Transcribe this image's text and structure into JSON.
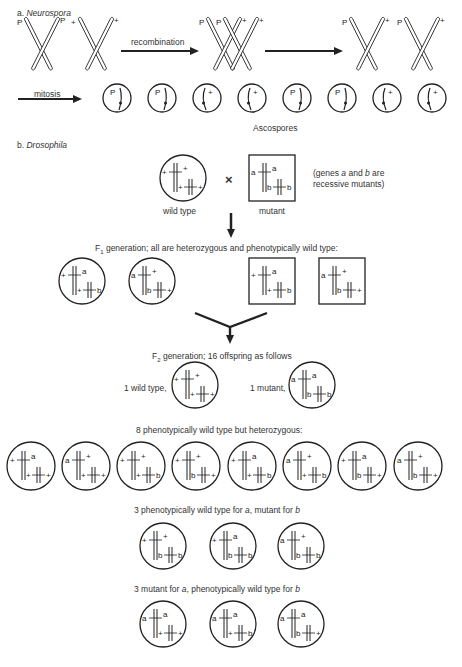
{
  "section_a": {
    "label": "a.",
    "organism": "Neurospora",
    "parental_chromosomes": [
      {
        "left_tip": "P",
        "right_tip": "P"
      },
      {
        "left_tip": "+",
        "right_tip": "+"
      }
    ],
    "recombination_label": "recombination",
    "recombinant_chromosomes": [
      {
        "left_tip": "P",
        "right_tip": "+"
      },
      {
        "left_tip": "P",
        "right_tip": "+"
      }
    ],
    "product_chromosomes": [
      {
        "left_tip": "P",
        "right_tip": "+"
      },
      {
        "left_tip": "P",
        "right_tip": "+"
      }
    ],
    "mitosis_label": "mitosis",
    "ascospores": [
      "P",
      "P",
      "+",
      "+",
      "P",
      "P",
      "+",
      "+"
    ],
    "ascospores_label": "Ascospores"
  },
  "section_b": {
    "label": "b.",
    "organism": "Drosophila",
    "parents": {
      "wild_type": {
        "shape": "circle",
        "chrom1": [
          "+",
          "+"
        ],
        "chrom2": [
          "+",
          "+"
        ],
        "label": "wild type"
      },
      "cross_symbol": "×",
      "mutant": {
        "shape": "square",
        "chrom1": [
          "a",
          "a"
        ],
        "chrom2": [
          "b",
          "b"
        ],
        "label": "mutant"
      },
      "note_line1_pre": "(genes ",
      "note_gene_a": "a",
      "note_line1_mid": " and ",
      "note_gene_b": "b",
      "note_line1_post": " are",
      "note_line2": "recessive mutants)"
    },
    "f1": {
      "heading_prefix": "F",
      "heading_sub": "1",
      "heading_text": " generation; all are heterozygous and phenotypically wild type:",
      "individuals": [
        {
          "shape": "circle",
          "chrom1": [
            "+",
            "a"
          ],
          "chrom2": [
            "+",
            "b"
          ]
        },
        {
          "shape": "circle",
          "chrom1": [
            "a",
            "+"
          ],
          "chrom2": [
            "b",
            "+"
          ]
        },
        {
          "shape": "square",
          "chrom1": [
            "+",
            "a"
          ],
          "chrom2": [
            "+",
            "b"
          ]
        },
        {
          "shape": "square",
          "chrom1": [
            "a",
            "+"
          ],
          "chrom2": [
            "b",
            "+"
          ]
        }
      ]
    },
    "f2": {
      "heading_prefix": "F",
      "heading_sub": "2",
      "heading_text": " generation; 16 offspring as follows",
      "wild_type_label": "1 wild type,",
      "wild_type_individual": {
        "chrom1": [
          "+",
          "+"
        ],
        "chrom2": [
          "+",
          "+"
        ]
      },
      "mutant_label": "1 mutant,",
      "mutant_individual": {
        "chrom1": [
          "a",
          "a"
        ],
        "chrom2": [
          "b",
          "b"
        ]
      },
      "heterozygous_heading": "8 phenotypically wild type but heterozygous:",
      "heterozygous": [
        {
          "chrom1": [
            "+",
            "a"
          ],
          "chrom2": [
            "+",
            "+"
          ]
        },
        {
          "chrom1": [
            "a",
            "+"
          ],
          "chrom2": [
            "+",
            "+"
          ]
        },
        {
          "chrom1": [
            "+",
            "+"
          ],
          "chrom2": [
            "+",
            "b"
          ]
        },
        {
          "chrom1": [
            "+",
            "+"
          ],
          "chrom2": [
            "b",
            "+"
          ]
        },
        {
          "chrom1": [
            "+",
            "a"
          ],
          "chrom2": [
            "+",
            "b"
          ]
        },
        {
          "chrom1": [
            "a",
            "+"
          ],
          "chrom2": [
            "+",
            "b"
          ]
        },
        {
          "chrom1": [
            "+",
            "a"
          ],
          "chrom2": [
            "b",
            "+"
          ]
        },
        {
          "chrom1": [
            "a",
            "+"
          ],
          "chrom2": [
            "b",
            "+"
          ]
        }
      ],
      "wt_a_mut_b_heading_pre": "3 phenotypically wild type for ",
      "wt_a_mut_b_gene_a": "a",
      "wt_a_mut_b_heading_mid": ", mutant for ",
      "wt_a_mut_b_gene_b": "b",
      "wt_a_mut_b": [
        {
          "chrom1": [
            "+",
            "+"
          ],
          "chrom2": [
            "b",
            "b"
          ]
        },
        {
          "chrom1": [
            "+",
            "a"
          ],
          "chrom2": [
            "b",
            "b"
          ]
        },
        {
          "chrom1": [
            "a",
            "+"
          ],
          "chrom2": [
            "b",
            "b"
          ]
        }
      ],
      "mut_a_wt_b_heading_pre": "3 mutant for ",
      "mut_a_wt_b_gene_a": "a",
      "mut_a_wt_b_heading_mid": ", phenotypically wild type for ",
      "mut_a_wt_b_gene_b": "b",
      "mut_a_wt_b": [
        {
          "chrom1": [
            "a",
            "a"
          ],
          "chrom2": [
            "+",
            "+"
          ]
        },
        {
          "chrom1": [
            "a",
            "a"
          ],
          "chrom2": [
            "+",
            "b"
          ]
        },
        {
          "chrom1": [
            "a",
            "a"
          ],
          "chrom2": [
            "b",
            "+"
          ]
        }
      ]
    }
  }
}
